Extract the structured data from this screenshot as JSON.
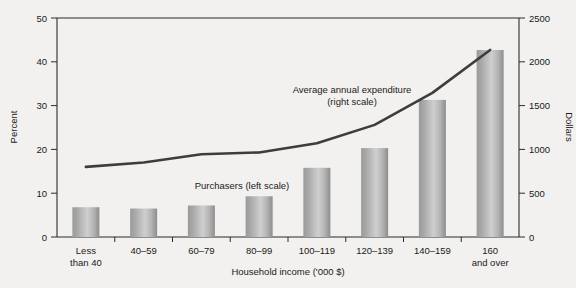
{
  "chart_data": {
    "type": "bar",
    "title": "",
    "xlabel": "Household income ('000 $)",
    "ylabel": "Percent",
    "y2label": "Dollars",
    "categories": [
      "Less than 40",
      "40–59",
      "60–79",
      "80–99",
      "100–119",
      "120–139",
      "140–159",
      "160 and over"
    ],
    "category_lines": [
      [
        "Less",
        "than 40"
      ],
      [
        "40–59",
        ""
      ],
      [
        "60–79",
        ""
      ],
      [
        "80–99",
        ""
      ],
      [
        "100–119",
        ""
      ],
      [
        "120–139",
        ""
      ],
      [
        "140–159",
        ""
      ],
      [
        "160",
        "and over"
      ]
    ],
    "ylim": [
      0,
      50
    ],
    "y2lim": [
      0,
      2500
    ],
    "yticks": [
      0,
      10,
      20,
      30,
      40,
      50
    ],
    "y2ticks": [
      0,
      500,
      1000,
      1500,
      2000,
      2500
    ],
    "grid": false,
    "legend_position": "inline-annotations",
    "series": [
      {
        "name": "Purchasers (left scale)",
        "type": "bar",
        "axis": "left",
        "unit": "percent",
        "values": [
          6.8,
          6.5,
          7.2,
          9.3,
          15.8,
          20.3,
          31.3,
          42.7
        ],
        "color": "#8f8f8f"
      },
      {
        "name": "Average annual expenditure (right scale)",
        "type": "line",
        "axis": "right",
        "unit": "dollars",
        "values": [
          800,
          850,
          945,
          965,
          1070,
          1280,
          1645,
          2135
        ],
        "color": "#3d3d3d"
      }
    ],
    "annotations": [
      {
        "text_line1": "Average annual expenditure",
        "text_line2": "(right scale)"
      },
      {
        "text_line1": "Purchasers (left scale)",
        "text_line2": ""
      }
    ]
  },
  "axes": {
    "left_title": "Percent",
    "right_title": "Dollars",
    "bottom_title": "Household income ('000 $)",
    "left_ticks": [
      "0",
      "10",
      "20",
      "30",
      "40",
      "50"
    ],
    "right_ticks": [
      "0",
      "500",
      "1000",
      "1500",
      "2000",
      "2500"
    ]
  },
  "categories_display": [
    {
      "l1": "Less",
      "l2": "than 40"
    },
    {
      "l1": "40–59",
      "l2": ""
    },
    {
      "l1": "60–79",
      "l2": ""
    },
    {
      "l1": "80–99",
      "l2": ""
    },
    {
      "l1": "100–119",
      "l2": ""
    },
    {
      "l1": "120–139",
      "l2": ""
    },
    {
      "l1": "140–159",
      "l2": ""
    },
    {
      "l1": "160",
      "l2": "and over"
    }
  ],
  "annotations": {
    "line_label_1": "Average annual expenditure",
    "line_label_2": "(right scale)",
    "bar_label": "Purchasers (left scale)"
  },
  "colors": {
    "background": "#f2f1ef",
    "plot_background": "#f2f1ef",
    "bar_light": "#c9c9c9",
    "bar_dark": "#8c8c8c",
    "line": "#3a3a3a",
    "axis": "#2b2b2b",
    "text": "#1a1a1a"
  }
}
